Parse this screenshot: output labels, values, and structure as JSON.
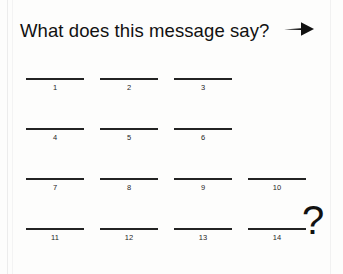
{
  "worksheet": {
    "prompt": "What does this message say?",
    "arrow_icon": "arrow-right-icon",
    "trailing_symbol": "?",
    "rows": [
      {
        "blanks": [
          {
            "number": "1",
            "value": "",
            "x": 26
          },
          {
            "number": "2",
            "value": "",
            "x": 100
          },
          {
            "number": "3",
            "value": "",
            "x": 174
          }
        ]
      },
      {
        "blanks": [
          {
            "number": "4",
            "value": "",
            "x": 26
          },
          {
            "number": "5",
            "value": "",
            "x": 100
          },
          {
            "number": "6",
            "value": "",
            "x": 174
          }
        ]
      },
      {
        "blanks": [
          {
            "number": "7",
            "value": "",
            "x": 26
          },
          {
            "number": "8",
            "value": "",
            "x": 100
          },
          {
            "number": "9",
            "value": "",
            "x": 174
          },
          {
            "number": "10",
            "value": "",
            "x": 248
          }
        ]
      },
      {
        "blanks": [
          {
            "number": "11",
            "value": "",
            "x": 26
          },
          {
            "number": "12",
            "value": "",
            "x": 100
          },
          {
            "number": "13",
            "value": "",
            "x": 174
          },
          {
            "number": "14",
            "value": "",
            "x": 248
          }
        ]
      }
    ]
  },
  "colors": {
    "ink": "#1a1a1a",
    "rule": "#232323",
    "paper": "#fdfdfc"
  }
}
